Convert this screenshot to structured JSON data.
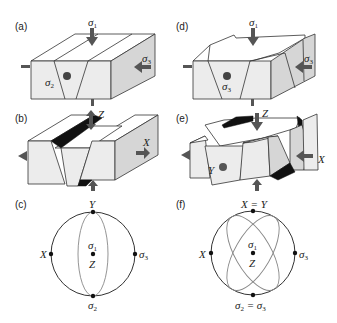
{
  "panels": [
    {
      "id": "a",
      "label": "(a)",
      "type": "block-diagram",
      "stress_labels": {
        "sigma1": "σ1",
        "sigma2": "σ2",
        "sigma3": "σ3"
      },
      "description": "Block with single conjugate graben set; σ1 vertical, σ3 horizontal along long axis, σ2 into page"
    },
    {
      "id": "b",
      "label": "(b)",
      "type": "block-diagram",
      "axis_labels": {
        "z": "Z",
        "x": "X"
      },
      "description": "Graben block opened; strain axes Z vertical, X horizontal extension"
    },
    {
      "id": "c",
      "label": "(c)",
      "type": "stereonet",
      "points": {
        "top": "Y",
        "left": "X",
        "right": "σ3",
        "center_upper": "σ1",
        "center_lower": "Z",
        "bottom": "σ2"
      }
    },
    {
      "id": "d",
      "label": "(d)",
      "type": "block-diagram",
      "stress_labels": {
        "sigma1": "σ1",
        "sigma3_front": "σ3",
        "sigma3_side": "σ3"
      },
      "description": "Block with two orthogonal fault sets; σ2 = σ3"
    },
    {
      "id": "e",
      "label": "(e)",
      "type": "block-diagram",
      "axis_labels": {
        "z": "Z",
        "y": "Y",
        "x": "X"
      },
      "description": "Orthorhombic faulting; extension in X and Y"
    },
    {
      "id": "f",
      "label": "(f)",
      "type": "stereonet",
      "points": {
        "top": "X = Y",
        "left": "X",
        "right": "σ3",
        "center_upper": "σ1",
        "center_lower": "Z",
        "bottom": "σ2 = σ3"
      }
    }
  ]
}
